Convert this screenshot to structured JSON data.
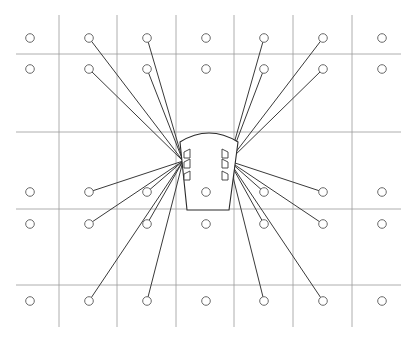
{
  "diagram": {
    "type": "cable-layout",
    "colors": {
      "background": "#ffffff",
      "grid": "#9a9a9a",
      "node_stroke": "#6a6a6a",
      "link": "#3a3a3a",
      "hub_stroke": "#2a2a2a"
    },
    "grid": {
      "columns": 7,
      "rows": 6
    },
    "nodes": {
      "rows": [
        "r1",
        "r2",
        "r3",
        "r4",
        "r5"
      ],
      "columns": [
        "c1",
        "c2",
        "c3",
        "c4",
        "c5",
        "c6",
        "c7"
      ],
      "inside_hub": [
        "r3-c4"
      ]
    },
    "hub": {
      "connector_banks": [
        {
          "side": "left",
          "connector_count": 3
        },
        {
          "side": "right",
          "connector_count": 3
        }
      ]
    },
    "connections": {
      "left": [
        "r1-c2",
        "r2-c2",
        "r1-c3",
        "r2-c3",
        "r3-c2",
        "r4-c2",
        "r3-c3",
        "r4-c3",
        "r5-c2",
        "r5-c3"
      ],
      "right": [
        "r1-c5",
        "r2-c5",
        "r1-c6",
        "r2-c6",
        "r3-c5",
        "r4-c5",
        "r3-c6",
        "r4-c6",
        "r5-c5",
        "r5-c6"
      ]
    }
  }
}
